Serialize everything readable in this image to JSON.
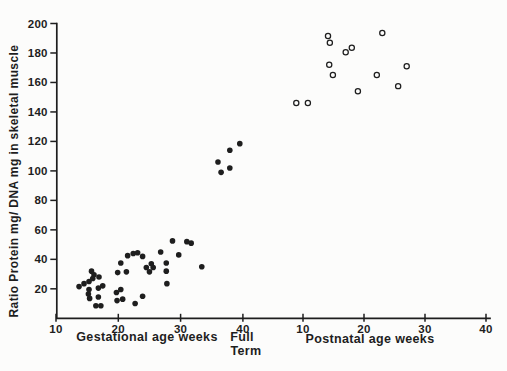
{
  "figure": {
    "background": "#fcfcfb",
    "ink": "#1e1e1e"
  },
  "chart_data": {
    "type": "scatter",
    "title": "",
    "ylabel": "Ratio Protein mg/ DNA mg in skeletal muscle",
    "grid": false,
    "legend": "none",
    "y_axis": {
      "min": 0,
      "max": 200,
      "ticks": [
        20,
        40,
        60,
        80,
        100,
        120,
        140,
        160,
        180,
        200
      ]
    },
    "x_axes": [
      {
        "id": "gestational",
        "label": "Gestational age weeks",
        "range": [
          10,
          40
        ],
        "ticks": [
          10,
          20,
          30,
          40
        ]
      },
      {
        "id": "postnatal",
        "label": "Postnatal age weeks",
        "range": [
          10,
          40
        ],
        "ticks": [
          10,
          20,
          30,
          40
        ]
      }
    ],
    "full_term_annotation": {
      "line1": "Full",
      "line2": "Term"
    },
    "series": [
      {
        "name": "Gestational age weeks",
        "axis": "gestational",
        "marker": "filled-circle",
        "color": "#1e1e1e",
        "points": [
          [
            13.7,
            21.5
          ],
          [
            14.5,
            23.5
          ],
          [
            15.3,
            25
          ],
          [
            15.7,
            32
          ],
          [
            16.1,
            29.5
          ],
          [
            15.9,
            27
          ],
          [
            16.9,
            28
          ],
          [
            17.5,
            22
          ],
          [
            16.8,
            20.5
          ],
          [
            15.3,
            19.5
          ],
          [
            15.2,
            16.5
          ],
          [
            15.4,
            13.5
          ],
          [
            16.8,
            14.5
          ],
          [
            16.4,
            8.5
          ],
          [
            17.2,
            8.5
          ],
          [
            19.7,
            17.5
          ],
          [
            20.4,
            19.5
          ],
          [
            19.8,
            12
          ],
          [
            20.7,
            13
          ],
          [
            22.7,
            10
          ],
          [
            23.9,
            15
          ],
          [
            20.4,
            37.5
          ],
          [
            19.9,
            31
          ],
          [
            21.3,
            31.5
          ],
          [
            21.5,
            42.5
          ],
          [
            22.4,
            44
          ],
          [
            23.1,
            44.5
          ],
          [
            23.9,
            42
          ],
          [
            24.5,
            34.5
          ],
          [
            25.3,
            37
          ],
          [
            25.6,
            34.5
          ],
          [
            25.0,
            31.5
          ],
          [
            26.8,
            45
          ],
          [
            27.7,
            37.5
          ],
          [
            27.7,
            32
          ],
          [
            27.8,
            23.5
          ],
          [
            28.7,
            52.5
          ],
          [
            31.0,
            52
          ],
          [
            31.7,
            51
          ],
          [
            29.7,
            43
          ],
          [
            33.4,
            35
          ],
          [
            36.0,
            106
          ],
          [
            36.5,
            99
          ],
          [
            37.9,
            114
          ],
          [
            37.9,
            102
          ],
          [
            39.5,
            118.5
          ]
        ]
      },
      {
        "name": "Postnatal age weeks",
        "axis": "postnatal",
        "marker": "open-circle",
        "color": "#1e1e1e",
        "points": [
          [
            8.9,
            146
          ],
          [
            10.8,
            146
          ],
          [
            14.1,
            191.5
          ],
          [
            14.4,
            187
          ],
          [
            17.0,
            180.5
          ],
          [
            18.0,
            183.5
          ],
          [
            14.3,
            172
          ],
          [
            14.9,
            165
          ],
          [
            19.0,
            154
          ],
          [
            22.1,
            165
          ],
          [
            23.0,
            193.5
          ],
          [
            25.6,
            157.5
          ],
          [
            27.0,
            171
          ]
        ]
      }
    ]
  }
}
